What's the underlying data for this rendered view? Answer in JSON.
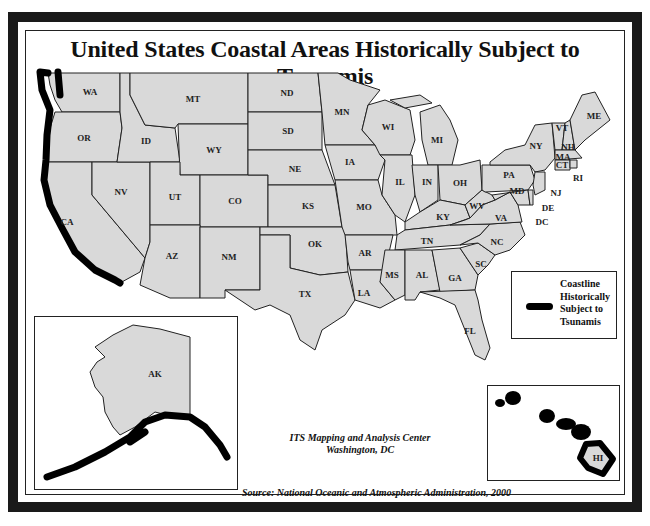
{
  "title": "United States Coastal Areas Historically Subject to Tsunamis",
  "legend": {
    "label_lines": [
      "Coastline",
      "Historically",
      "Subject to",
      "Tsunamis"
    ],
    "swatch_color": "#000000"
  },
  "credit": {
    "line1": "ITS Mapping and Analysis Center",
    "line2": "Washington, DC"
  },
  "source": "Source: National Oceanic and Atmospheric Administration, 2000",
  "colors": {
    "state_fill": "#d9d9d9",
    "state_stroke": "#222222",
    "frame": "#1a1a1a",
    "coastline_highlight": "#000000",
    "background": "#ffffff"
  },
  "states": [
    {
      "abbr": "WA"
    },
    {
      "abbr": "OR"
    },
    {
      "abbr": "CA"
    },
    {
      "abbr": "NV"
    },
    {
      "abbr": "ID"
    },
    {
      "abbr": "MT"
    },
    {
      "abbr": "WY"
    },
    {
      "abbr": "UT"
    },
    {
      "abbr": "CO"
    },
    {
      "abbr": "AZ"
    },
    {
      "abbr": "NM"
    },
    {
      "abbr": "ND"
    },
    {
      "abbr": "SD"
    },
    {
      "abbr": "NE"
    },
    {
      "abbr": "KS"
    },
    {
      "abbr": "OK"
    },
    {
      "abbr": "TX"
    },
    {
      "abbr": "MN"
    },
    {
      "abbr": "IA"
    },
    {
      "abbr": "MO"
    },
    {
      "abbr": "AR"
    },
    {
      "abbr": "LA"
    },
    {
      "abbr": "WI"
    },
    {
      "abbr": "IL"
    },
    {
      "abbr": "MI"
    },
    {
      "abbr": "IN"
    },
    {
      "abbr": "OH"
    },
    {
      "abbr": "KY"
    },
    {
      "abbr": "TN"
    },
    {
      "abbr": "MS"
    },
    {
      "abbr": "AL"
    },
    {
      "abbr": "GA"
    },
    {
      "abbr": "FL"
    },
    {
      "abbr": "SC"
    },
    {
      "abbr": "NC"
    },
    {
      "abbr": "VA"
    },
    {
      "abbr": "WV"
    },
    {
      "abbr": "PA"
    },
    {
      "abbr": "NY"
    },
    {
      "abbr": "VT"
    },
    {
      "abbr": "NH"
    },
    {
      "abbr": "ME"
    },
    {
      "abbr": "MA"
    },
    {
      "abbr": "CT"
    },
    {
      "abbr": "RI"
    },
    {
      "abbr": "NJ"
    },
    {
      "abbr": "DE"
    },
    {
      "abbr": "MD"
    },
    {
      "abbr": "DC"
    },
    {
      "abbr": "AK"
    },
    {
      "abbr": "HI"
    }
  ],
  "highlighted_coastlines": [
    "WA",
    "OR",
    "CA",
    "AK",
    "HI"
  ]
}
